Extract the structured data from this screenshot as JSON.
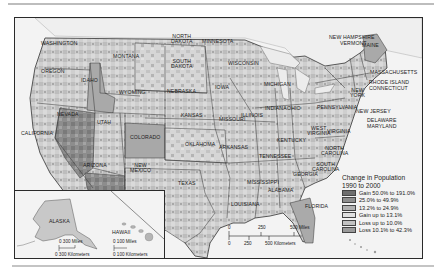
{
  "map": {
    "legend": {
      "title_line1": "Change in Population",
      "title_line2": "1990 to 2000",
      "items": [
        {
          "label": "Gain 50.0% to 191.0%",
          "color": "#6e6e6e"
        },
        {
          "label": "25.0% to 49.9%",
          "color": "#8e8e8e"
        },
        {
          "label": "13.2% to 24.9%",
          "color": "#b0b0b0"
        },
        {
          "label": "Gain up to 13.1%",
          "color": "#dcdcdc"
        },
        {
          "label": "Loss up to 10.0%",
          "color": "#c2c2c2"
        },
        {
          "label": "Loss 10.1% to 42.3%",
          "color": "#9a9a9a"
        }
      ]
    },
    "scale_bar": {
      "miles": {
        "ticks": [
          "0",
          "250",
          "500 Miles"
        ]
      },
      "kilometers": {
        "ticks": [
          "0",
          "250",
          "500 Kilometers"
        ]
      }
    },
    "insets": {
      "alaska": {
        "label": "ALASKA",
        "scale_miles": "0  300 Miles",
        "scale_km": "0 300 Kilometers"
      },
      "hawaii": {
        "label": "HAWAII",
        "scale_miles": "0  100 Miles",
        "scale_km": "0  100 Kilometers"
      }
    },
    "state_labels": {
      "washington": "WASHINGTON",
      "oregon": "OREGON",
      "california": "CALIFORNIA",
      "nevada": "NEVADA",
      "idaho": "IDAHO",
      "montana": "MONTANA",
      "wyoming": "WYOMING",
      "utah": "UTAH",
      "colorado": "COLORADO",
      "arizona": "ARIZONA",
      "new_mexico_1": "NEW",
      "new_mexico_2": "MEXICO",
      "north_dakota_1": "NORTH",
      "north_dakota_2": "DAKOTA",
      "south_dakota_1": "SOUTH",
      "south_dakota_2": "DAKOTA",
      "nebraska": "NEBRASKA",
      "kansas": "KANSAS",
      "oklahoma": "OKLAHOMA",
      "texas": "TEXAS",
      "minnesota": "MINNESOTA",
      "iowa": "IOWA",
      "missouri": "MISSOURI",
      "arkansas": "ARKANSAS",
      "louisiana": "LOUISIANA",
      "wisconsin": "WISCONSIN",
      "illinois": "ILLINOIS",
      "michigan": "MICHIGAN",
      "indiana": "INDIANA",
      "ohio": "OHIO",
      "kentucky": "KENTUCKY",
      "tennessee": "TENNESSEE",
      "mississippi": "MISSISSIPPI",
      "alabama": "ALABAMA",
      "georgia": "GEORGIA",
      "florida": "FLORIDA",
      "south_carolina_1": "SOUTH",
      "south_carolina_2": "CAROLINA",
      "north_carolina_1": "NORTH",
      "north_carolina_2": "CAROLINA",
      "virginia": "VIRGINIA",
      "west_virginia_1": "WEST",
      "west_virginia_2": "VIRGINIA",
      "pennsylvania": "PENNSYLVANIA",
      "new_york_1": "NEW",
      "new_york_2": "YORK",
      "new_jersey": "NEW JERSEY",
      "delaware": "DELAWARE",
      "maryland": "MARYLAND",
      "new_hampshire": "NEW HAMPSHIRE",
      "vermont": "VERMONT",
      "maine": "MAINE",
      "massachusetts": "MASSACHUSETTS",
      "rhode_island": "RHODE ISLAND",
      "connecticut": "CONNECTICUT"
    }
  }
}
